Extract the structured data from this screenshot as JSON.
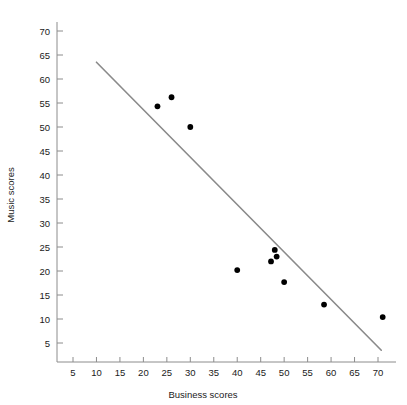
{
  "chart_data": {
    "type": "scatter",
    "title": "",
    "xlabel": "Business scores",
    "ylabel": "Music scores",
    "xlim": [
      0,
      75
    ],
    "ylim": [
      0,
      73
    ],
    "grid": false,
    "legend": null,
    "xticks": [
      5,
      10,
      15,
      20,
      25,
      30,
      35,
      40,
      45,
      50,
      55,
      60,
      65,
      70
    ],
    "yticks": [
      5,
      10,
      15,
      20,
      25,
      30,
      35,
      40,
      45,
      50,
      55,
      60,
      65,
      70
    ],
    "xtick_labels": [
      "5",
      "10",
      "15",
      "20",
      "25",
      "30",
      "35",
      "40",
      "45",
      "50",
      "55",
      "60",
      "65",
      "70"
    ],
    "ytick_labels": [
      "5",
      "10",
      "15",
      "20",
      "25",
      "30",
      "35",
      "40",
      "45",
      "50",
      "55",
      "60",
      "65",
      "70"
    ],
    "series": [
      {
        "name": "scores",
        "marker": "filled-circle",
        "color": "#000000",
        "points": [
          {
            "x": 23.0,
            "y": 54.3
          },
          {
            "x": 26.0,
            "y": 56.2
          },
          {
            "x": 30.0,
            "y": 50.0
          },
          {
            "x": 40.0,
            "y": 20.2
          },
          {
            "x": 47.2,
            "y": 22.0
          },
          {
            "x": 48.0,
            "y": 24.4
          },
          {
            "x": 48.4,
            "y": 23.0
          },
          {
            "x": 50.0,
            "y": 17.7
          },
          {
            "x": 58.5,
            "y": 13.0
          },
          {
            "x": 71.0,
            "y": 10.4
          }
        ]
      }
    ],
    "trend_line": {
      "name": "regression-line",
      "color": "#8a8a8a",
      "x_start": 10.0,
      "y_start": 63.5,
      "x_end": 70.7,
      "y_end": 3.5
    },
    "axis_color": "#8c8c8c",
    "background": "#ffffff"
  }
}
